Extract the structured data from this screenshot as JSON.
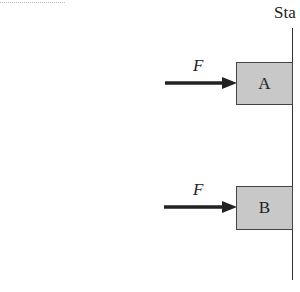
{
  "wall": {
    "label": "Sta"
  },
  "blocks": [
    {
      "label": "A",
      "force_label": "F"
    },
    {
      "label": "B",
      "force_label": "F"
    }
  ]
}
